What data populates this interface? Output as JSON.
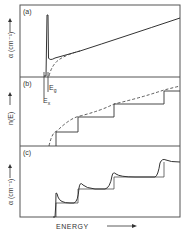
{
  "figure": {
    "panels": [
      {
        "id": "a",
        "label": "(a)",
        "ylabel": "α (cm⁻¹)"
      },
      {
        "id": "b",
        "label": "(b)",
        "ylabel": "n(E)"
      },
      {
        "id": "c",
        "label": "(c)",
        "ylabel": "α (cm⁻¹)"
      }
    ],
    "annotations": {
      "eg": "E",
      "eg_sub": "g",
      "ex": "E",
      "ex_sub": "x"
    },
    "xlabel": "ENERGY",
    "colors": {
      "line": "#333333",
      "frame": "#555555",
      "background": "#ffffff"
    }
  }
}
